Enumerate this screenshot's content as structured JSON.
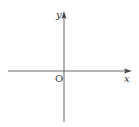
{
  "diagram": {
    "type": "cartesian-axes",
    "labels": {
      "x_axis": "x",
      "y_axis": "y",
      "origin": "O"
    },
    "colors": {
      "axis": "#666666",
      "text": "#333333",
      "background": "#ffffff"
    }
  }
}
